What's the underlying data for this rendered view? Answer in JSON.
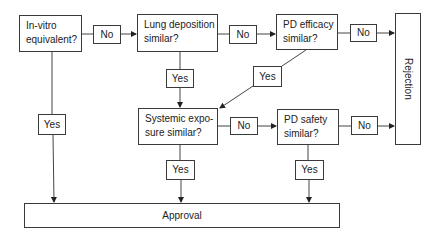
{
  "diagram": {
    "decisions": {
      "in_vitro": "In-vitro equivalent?",
      "lung_deposition": "Lung deposition similar?",
      "pd_efficacy": "PD efficacy similar?",
      "systemic_exposure": "Systemic expo-sure similar?",
      "pd_safety": "PD safety similar?"
    },
    "decision_lines": {
      "in_vitro": [
        "In-vitro",
        "equivalent?"
      ],
      "lung_deposition": [
        "Lung deposition",
        "similar?"
      ],
      "pd_efficacy": [
        "PD efficacy",
        "similar?"
      ],
      "systemic_exposure": [
        "Systemic expo-",
        "sure similar?"
      ],
      "pd_safety": [
        "PD safety",
        "similar?"
      ]
    },
    "edge_labels": {
      "no": "No",
      "yes": "Yes"
    },
    "outcomes": {
      "rejection": "Rejection",
      "approval": "Approval"
    }
  }
}
